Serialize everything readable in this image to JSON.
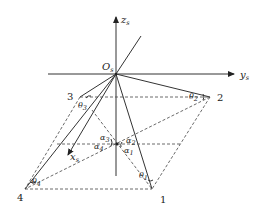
{
  "diagram": {
    "axes": {
      "z": {
        "label": "z",
        "subscript": "s"
      },
      "y": {
        "label": "y",
        "subscript": "s"
      },
      "x": {
        "label": "x",
        "subscript": "s"
      },
      "origin": {
        "label": "O",
        "subscript": "s"
      }
    },
    "points": [
      {
        "id": "1",
        "label": "1"
      },
      {
        "id": "2",
        "label": "2"
      },
      {
        "id": "3",
        "label": "3"
      },
      {
        "id": "4",
        "label": "4"
      }
    ],
    "theta_angles": [
      {
        "label": "θ",
        "subscript": "1"
      },
      {
        "label": "θ",
        "subscript": "2"
      },
      {
        "label": "θ",
        "subscript": "3"
      },
      {
        "label": "θ",
        "subscript": "4"
      }
    ],
    "alpha_angles": [
      {
        "label": "α",
        "subscript": "1"
      },
      {
        "label": "α",
        "subscript": "2"
      },
      {
        "label": "α",
        "subscript": "3"
      },
      {
        "label": "α",
        "subscript": "4"
      }
    ]
  }
}
